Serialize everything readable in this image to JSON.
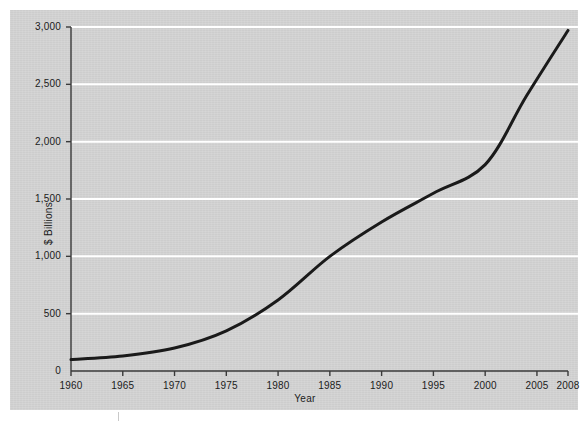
{
  "chart_data": {
    "type": "line",
    "title": "",
    "subtitle": "",
    "xlabel": "Year",
    "ylabel": "$ Billions",
    "xlim": [
      1960,
      2008
    ],
    "ylim": [
      0,
      3000
    ],
    "grid": true,
    "grid_axis": "y",
    "legend": "none",
    "x_tick_labels": [
      "1960",
      "1965",
      "1970",
      "1975",
      "1980",
      "1985",
      "1990",
      "1995",
      "2000",
      "2005",
      "2008"
    ],
    "x_ticks": [
      1960,
      1965,
      1970,
      1975,
      1980,
      1985,
      1990,
      1995,
      2000,
      2005,
      2008
    ],
    "y_tick_labels": [
      "0",
      "500",
      "1,000",
      "1,500",
      "2,000",
      "2,500",
      "3,000"
    ],
    "y_ticks": [
      0,
      500,
      1000,
      1500,
      2000,
      2500,
      3000
    ],
    "series": [
      {
        "name": "Value",
        "color": "#1a1a1a",
        "line_width": 3,
        "x": [
          1960,
          1965,
          1970,
          1975,
          1980,
          1985,
          1990,
          1995,
          2000,
          2004,
          2008
        ],
        "values": [
          100,
          130,
          200,
          350,
          620,
          1000,
          1300,
          1550,
          1800,
          2400,
          2970
        ]
      }
    ],
    "colors": {
      "panel_background": "#d4d4d4",
      "page_background": "#ffffff",
      "gridline": "#ffffff",
      "axis": "#3a3a3a",
      "line": "#1a1a1a",
      "text": "#1b1b1b"
    }
  },
  "axes": {
    "x_title": "Year",
    "y_title": "$ Billions"
  }
}
